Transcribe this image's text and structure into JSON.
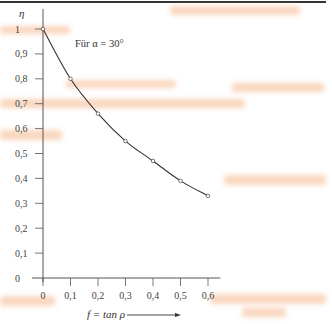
{
  "chart_data": {
    "type": "line",
    "title": "",
    "annotation": "Für α = 30°",
    "xlabel": "f = tan ρ",
    "ylabel": "η",
    "xlim": [
      0,
      0.6
    ],
    "ylim": [
      0,
      1
    ],
    "x_ticks": [
      "0",
      "0,1",
      "0,2",
      "0,3",
      "0,4",
      "0,5",
      "0,6"
    ],
    "y_ticks": [
      "0",
      "0,1",
      "0,2",
      "0,3",
      "0,4",
      "0,5",
      "0,6",
      "0,7",
      "0,8",
      "0,9",
      "1"
    ],
    "grid": false,
    "legend": null,
    "series": [
      {
        "name": "η (α = 30°)",
        "x": [
          0,
          0.1,
          0.2,
          0.3,
          0.4,
          0.5,
          0.6
        ],
        "y": [
          1.0,
          0.8,
          0.66,
          0.55,
          0.47,
          0.39,
          0.33
        ],
        "markers": "circle"
      }
    ],
    "line_color": "#333333"
  }
}
